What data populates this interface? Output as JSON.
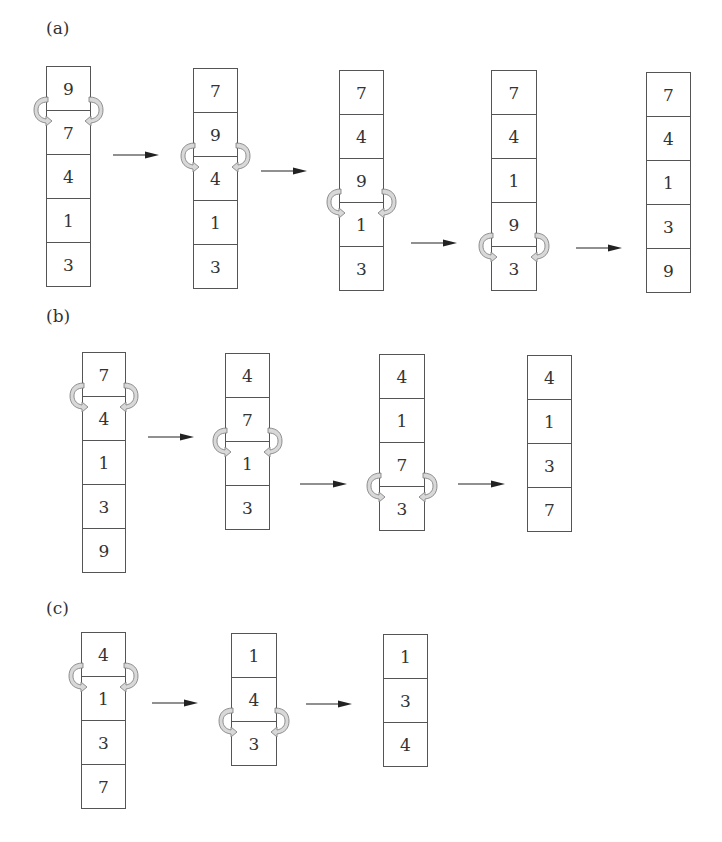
{
  "panels": [
    {
      "label": "(a)",
      "label_pos": [
        46,
        18
      ],
      "steps": [
        {
          "x": 46,
          "y": 66,
          "w": 45,
          "values": [
            "9",
            "7",
            "4",
            "1",
            "3"
          ],
          "swap_between": [
            0,
            1
          ]
        },
        {
          "x": 193,
          "y": 68,
          "w": 45,
          "values": [
            "7",
            "9",
            "4",
            "1",
            "3"
          ],
          "swap_between": [
            1,
            2
          ]
        },
        {
          "x": 339,
          "y": 70,
          "w": 45,
          "values": [
            "7",
            "4",
            "9",
            "1",
            "3"
          ],
          "swap_between": [
            2,
            3
          ]
        },
        {
          "x": 491,
          "y": 70,
          "w": 46,
          "values": [
            "7",
            "4",
            "1",
            "9",
            "3"
          ],
          "swap_between": [
            3,
            4
          ]
        },
        {
          "x": 646,
          "y": 72,
          "w": 45,
          "values": [
            "7",
            "4",
            "1",
            "3",
            "9"
          ],
          "swap_between": null
        }
      ],
      "arrows": [
        {
          "x": 113,
          "y": 155,
          "len": 46
        },
        {
          "x": 261,
          "y": 171,
          "len": 46
        },
        {
          "x": 411,
          "y": 243,
          "len": 46
        },
        {
          "x": 576,
          "y": 248,
          "len": 46
        }
      ]
    },
    {
      "label": "(b)",
      "label_pos": [
        46,
        306
      ],
      "steps": [
        {
          "x": 82,
          "y": 352,
          "w": 44,
          "values": [
            "7",
            "4",
            "1",
            "3",
            "9"
          ],
          "swap_between": [
            0,
            1
          ]
        },
        {
          "x": 225,
          "y": 353,
          "w": 45,
          "values": [
            "4",
            "7",
            "1",
            "3"
          ],
          "swap_between": [
            1,
            2
          ]
        },
        {
          "x": 379,
          "y": 354,
          "w": 46,
          "values": [
            "4",
            "1",
            "7",
            "3"
          ],
          "swap_between": [
            2,
            3
          ]
        },
        {
          "x": 527,
          "y": 355,
          "w": 45,
          "values": [
            "4",
            "1",
            "3",
            "7"
          ],
          "swap_between": null
        }
      ],
      "arrows": [
        {
          "x": 148,
          "y": 437,
          "len": 46
        },
        {
          "x": 300,
          "y": 484,
          "len": 47
        },
        {
          "x": 458,
          "y": 484,
          "len": 47
        }
      ]
    },
    {
      "label": "(c)",
      "label_pos": [
        46,
        598
      ],
      "steps": [
        {
          "x": 81,
          "y": 632,
          "w": 45,
          "values": [
            "4",
            "1",
            "3",
            "7"
          ],
          "swap_between": [
            0,
            1
          ]
        },
        {
          "x": 231,
          "y": 633,
          "w": 46,
          "values": [
            "1",
            "4",
            "3"
          ],
          "swap_between": [
            1,
            2
          ]
        },
        {
          "x": 383,
          "y": 634,
          "w": 45,
          "values": [
            "1",
            "3",
            "4"
          ],
          "swap_between": null
        }
      ],
      "arrows": [
        {
          "x": 152,
          "y": 703,
          "len": 46
        },
        {
          "x": 306,
          "y": 704,
          "len": 46
        }
      ]
    }
  ],
  "cell_height": 44,
  "colors": {
    "line": "#555555",
    "text": "#333333",
    "swap_fill": "#d8d8d8",
    "arrow": "#222222"
  }
}
